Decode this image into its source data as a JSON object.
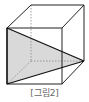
{
  "figure": {
    "caption": "[그림2]",
    "colors": {
      "edge": "#222222",
      "hidden_edge": "#888888",
      "shade": "#d9d9d9"
    },
    "vertices": {
      "front_top_left": [
        7,
        28
      ],
      "front_top_right": [
        62,
        28
      ],
      "front_bottom_left": [
        7,
        84
      ],
      "front_bottom_right": [
        62,
        84
      ],
      "back_top_left": [
        31,
        5
      ],
      "back_top_right": [
        84,
        5
      ],
      "back_bottom_left": [
        31,
        61
      ],
      "back_bottom_right": [
        84,
        61
      ]
    },
    "shaded_triangle": [
      "front_top_left",
      "front_bottom_left",
      "back_bottom_right"
    ]
  }
}
